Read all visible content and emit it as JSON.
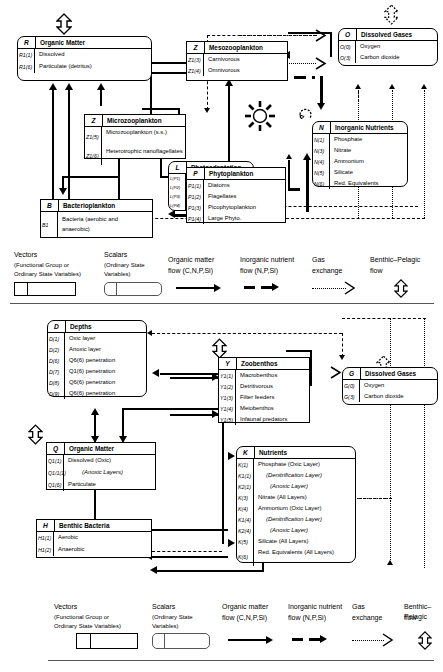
{
  "figure": {
    "panels": [
      "pelagic",
      "benthic"
    ]
  },
  "pelagic": {
    "boxes": [
      {
        "id": "R",
        "symbol": "R",
        "title": "Organic Matter",
        "shape": "rect",
        "rows": [
          {
            "sym": "R1(1)",
            "label": "Dissolved"
          },
          {
            "sym": "R1(6)",
            "label": "Particulate (detritus)"
          }
        ]
      },
      {
        "id": "Z_meso",
        "symbol": "Z",
        "title": "Mesozooplankton",
        "shape": "rect",
        "rows": [
          {
            "sym": "Z1(3)",
            "label": "Carnivorous"
          },
          {
            "sym": "Z1(4)",
            "label": "Omnivorous"
          }
        ]
      },
      {
        "id": "O",
        "symbol": "O",
        "title": "Dissolved Gases",
        "shape": "round",
        "rows": [
          {
            "sym": "O(0)",
            "label": "Oxygen"
          },
          {
            "sym": "O(3)",
            "label": "Carbon dioxide"
          }
        ]
      },
      {
        "id": "Z_micro",
        "symbol": "Z",
        "title": "Microzooplankton",
        "shape": "rect",
        "rows": [
          {
            "sym": "Z1(5)",
            "label": "Microzooplankton (s.s.)"
          },
          {
            "sym": "Z1(6)",
            "label": "Heterotrophic nanoflagellates"
          }
        ]
      },
      {
        "id": "N",
        "symbol": "N",
        "title": "Inorganic Nutrients",
        "shape": "round",
        "rows": [
          {
            "sym": "N(1)",
            "label": "Phosphate"
          },
          {
            "sym": "N(3)",
            "label": "Nitrate"
          },
          {
            "sym": "N(4)",
            "label": "Ammonium"
          },
          {
            "sym": "N(5)",
            "label": "Silicate"
          },
          {
            "sym": "N(6)",
            "label": "Red. Equivalents"
          }
        ]
      },
      {
        "id": "L",
        "symbol": "L",
        "title": "Photoadaptation",
        "shape": "round",
        "rows": [
          {
            "sym": "L(P1)",
            "label": ""
          },
          {
            "sym": "L(P2)",
            "label": ""
          },
          {
            "sym": "L(P3)",
            "label": ""
          },
          {
            "sym": "L(P4)",
            "label": ""
          }
        ]
      },
      {
        "id": "P",
        "symbol": "P",
        "title": "Phytoplankton",
        "shape": "rect",
        "rows": [
          {
            "sym": "P1(1)",
            "label": "Diatoms"
          },
          {
            "sym": "P1(2)",
            "label": "Flagellates"
          },
          {
            "sym": "P1(3)",
            "label": "Picophytoplankton"
          },
          {
            "sym": "P1(4)",
            "label": "Large Phyto."
          }
        ]
      },
      {
        "id": "B",
        "symbol": "B",
        "title": "Bacterioplankton",
        "shape": "rect",
        "rows": [
          {
            "sym": "B1",
            "label": "Bacteria (aerobic and anaerobic)"
          }
        ]
      }
    ]
  },
  "benthic": {
    "boxes": [
      {
        "id": "D",
        "symbol": "D",
        "title": "Depths",
        "shape": "round",
        "rows": [
          {
            "sym": "D(1)",
            "label": "Oxic layer"
          },
          {
            "sym": "D(2)",
            "label": "Anoxic layer"
          },
          {
            "sym": "D(6)",
            "label": "Q6(6) penetration"
          },
          {
            "sym": "D(7)",
            "label": "Q1(6) penetration"
          },
          {
            "sym": "D(8)",
            "label": "Q6(6) penetration"
          },
          {
            "sym": "D(9)",
            "label": "Q6(6) penetration"
          }
        ]
      },
      {
        "id": "Y",
        "symbol": "Y",
        "title": "Zoobenthos",
        "shape": "rect",
        "rows": [
          {
            "sym": "Y1(1)",
            "label": "Macrobenthos"
          },
          {
            "sym": "Y1(2)",
            "label": "Detritivorous"
          },
          {
            "sym": "Y1(3)",
            "label": "Filter feeders"
          },
          {
            "sym": "Y1(4)",
            "label": "Meiobenthos"
          },
          {
            "sym": "Y1(5)",
            "label": "Infaunal predators"
          }
        ]
      },
      {
        "id": "G",
        "symbol": "G",
        "title": "Dissolved Gases",
        "shape": "round",
        "rows": [
          {
            "sym": "G(0)",
            "label": "Oxygen"
          },
          {
            "sym": "G(3)",
            "label": "Carbon dioxide"
          }
        ]
      },
      {
        "id": "Q",
        "symbol": "Q",
        "title": "Organic Matter",
        "shape": "rect",
        "rows": [
          {
            "sym": "Q1(1)",
            "label": "Dissolved (Oxic)"
          },
          {
            "sym": "Q1/1(1)",
            "label": "(Anoxic Layers)"
          },
          {
            "sym": "Q1(6)",
            "label": "Particulate"
          }
        ]
      },
      {
        "id": "K",
        "symbol": "K",
        "title": "Nutrients",
        "shape": "round",
        "rows": [
          {
            "sym": "K(1)",
            "label": "Phosphate (Oxic Layer)"
          },
          {
            "sym": "K1(1)",
            "label": "(Denitrification Layer)"
          },
          {
            "sym": "K2(1)",
            "label": "(Anoxic Layer)"
          },
          {
            "sym": "K(3)",
            "label": "Nitrate (All Layers)"
          },
          {
            "sym": "K(4)",
            "label": "Ammonium (Oxic Layer)"
          },
          {
            "sym": "K1(4)",
            "label": "(Denitrification Layer)"
          },
          {
            "sym": "K2(4)",
            "label": "(Anoxic Layer)"
          },
          {
            "sym": "K(5)",
            "label": "Silicate (All Layers)"
          },
          {
            "sym": "K(6)",
            "label": "Red. Equivalents (All Layers)"
          }
        ]
      },
      {
        "id": "H",
        "symbol": "H",
        "title": "Benthic Bacteria",
        "shape": "rect",
        "rows": [
          {
            "sym": "H1(1)",
            "label": "Aerobic"
          },
          {
            "sym": "H1(2)",
            "label": "Anaerobic"
          }
        ]
      }
    ]
  },
  "legend": {
    "vectors": {
      "title": "Vectors",
      "sub1": "(Functional Group or",
      "sub2": "Ordinary State Variables)"
    },
    "scalars": {
      "title": "Scalars",
      "sub1": "(Ordinary State",
      "sub2": "Variables)"
    },
    "organic": {
      "line1": "Organic matter",
      "line2": "flow (C,N,P,Si)"
    },
    "nutrient": {
      "line1": "Inorganic nutrient",
      "line2": "flow (N,P,Si)"
    },
    "gas": {
      "line1": "Gas",
      "line2": "exchange"
    },
    "benthic_pelagic": {
      "line1": "Benthic–Pelagic",
      "line2": "flow"
    }
  }
}
